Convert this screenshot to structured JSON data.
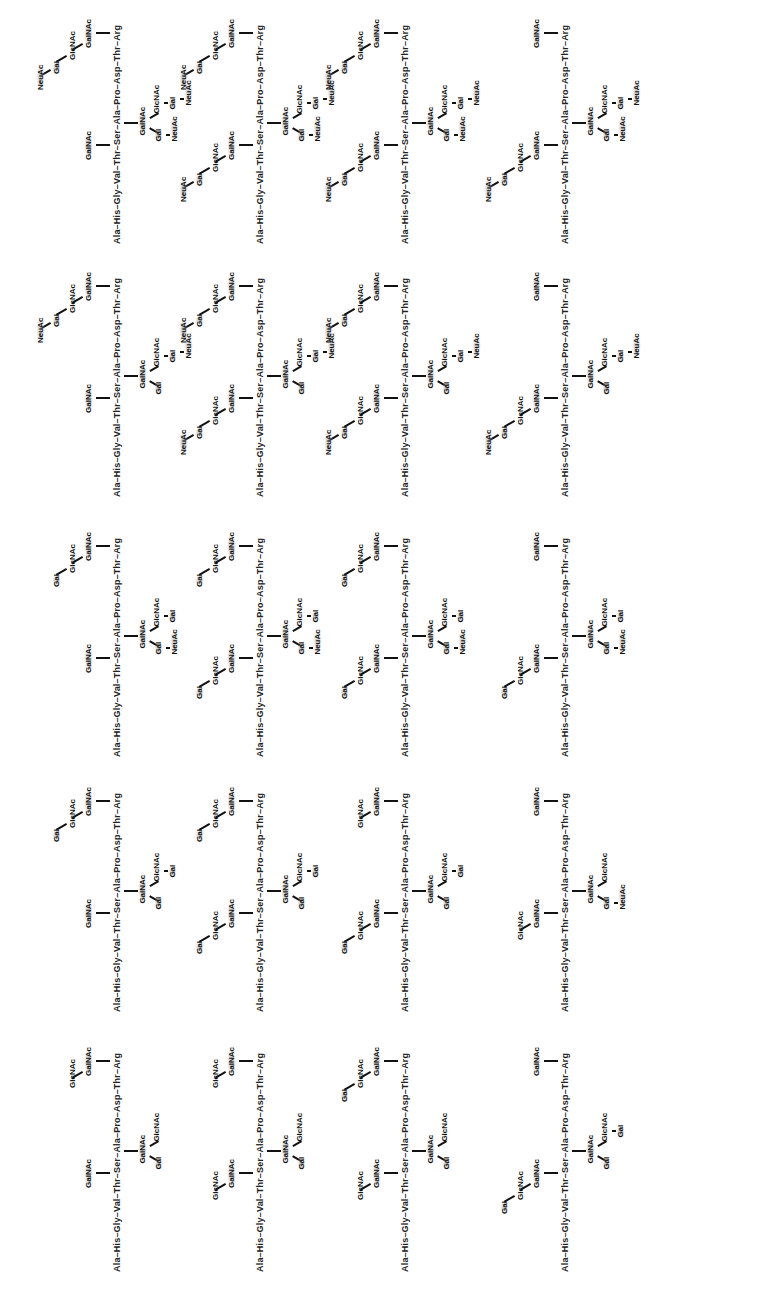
{
  "figure": {
    "orientation": "rotated-90-ccw",
    "peptide": [
      "Ala",
      "His",
      "Gly",
      "Val",
      "Thr",
      "Ser",
      "Ala",
      "Pro",
      "Asp",
      "Thr",
      "Arg"
    ],
    "glycosylation_sites": [
      "Thr5",
      "Ser6",
      "Thr10"
    ],
    "grid": {
      "columns": 4,
      "bands": 5
    },
    "structures": [
      {
        "id": "c0b0",
        "thr5": [
          "GalNAc"
        ],
        "ser6": {
          "core": "GalNAc",
          "arm3": [
            "Gal",
            "NeuAc"
          ],
          "arm6": [
            "GlcNAc",
            "Gal",
            "NeuAc"
          ]
        },
        "thr10": [
          "GalNAc",
          "GlcNAc",
          "Gal",
          "NeuAc"
        ]
      },
      {
        "id": "c0b1",
        "thr5": [
          "GalNAc"
        ],
        "ser6": {
          "core": "GalNAc",
          "arm3": [
            "Gal"
          ],
          "arm6": [
            "GlcNAc",
            "Gal",
            "NeuAc"
          ]
        },
        "thr10": [
          "GalNAc",
          "GlcNAc",
          "Gal",
          "NeuAc"
        ]
      },
      {
        "id": "c0b2",
        "thr5": [
          "GalNAc"
        ],
        "ser6": {
          "core": "GalNAc",
          "arm3": [
            "Gal",
            "NeuAc"
          ],
          "arm6": [
            "GlcNAc",
            "Gal"
          ]
        },
        "thr10": [
          "GalNAc",
          "GlcNAc",
          "Gal"
        ]
      },
      {
        "id": "c0b3",
        "thr5": [
          "GalNAc"
        ],
        "ser6": {
          "core": "GalNAc",
          "arm3": [
            "Gal"
          ],
          "arm6": [
            "GlcNAc",
            "Gal"
          ]
        },
        "thr10": [
          "GalNAc",
          "GlcNAc",
          "Gal"
        ]
      },
      {
        "id": "c0b4",
        "thr5": [
          "GalNAc"
        ],
        "ser6": {
          "core": "GalNAc",
          "arm3": [
            "Gal"
          ],
          "arm6": [
            "GlcNAc"
          ]
        },
        "thr10": [
          "GalNAc",
          "GlcNAc"
        ]
      },
      {
        "id": "c1b0",
        "thr5": [
          "GalNAc",
          "GlcNAc",
          "Gal",
          "NeuAc"
        ],
        "ser6": {
          "core": "GalNAc",
          "arm3": [
            "Gal",
            "NeuAc"
          ],
          "arm6": [
            "GlcNAc",
            "Gal",
            "NeuAc"
          ]
        },
        "thr10": [
          "GalNAc",
          "GlcNAc",
          "Gal",
          "NeuAc"
        ]
      },
      {
        "id": "c1b1",
        "thr5": [
          "GalNAc",
          "GlcNAc",
          "Gal",
          "NeuAc"
        ],
        "ser6": {
          "core": "GalNAc",
          "arm3": [
            "Gal"
          ],
          "arm6": [
            "GlcNAc",
            "Gal",
            "NeuAc"
          ]
        },
        "thr10": [
          "GalNAc",
          "GlcNAc",
          "Gal",
          "NeuAc"
        ]
      },
      {
        "id": "c1b2",
        "thr5": [
          "GalNAc",
          "GlcNAc",
          "Gal"
        ],
        "ser6": {
          "core": "GalNAc",
          "arm3": [
            "Gal",
            "NeuAc"
          ],
          "arm6": [
            "GlcNAc",
            "Gal"
          ]
        },
        "thr10": [
          "GalNAc",
          "GlcNAc",
          "Gal"
        ]
      },
      {
        "id": "c1b3",
        "thr5": [
          "GalNAc",
          "GlcNAc",
          "Gal"
        ],
        "ser6": {
          "core": "GalNAc",
          "arm3": [
            "Gal"
          ],
          "arm6": [
            "GlcNAc",
            "Gal"
          ]
        },
        "thr10": [
          "GalNAc",
          "GlcNAc",
          "Gal"
        ]
      },
      {
        "id": "c1b4",
        "thr5": [
          "GalNAc",
          "GlcNAc"
        ],
        "ser6": {
          "core": "GalNAc",
          "arm3": [
            "Gal"
          ],
          "arm6": [
            "GlcNAc"
          ]
        },
        "thr10": [
          "GalNAc",
          "GlcNAc"
        ]
      },
      {
        "id": "c2b0",
        "thr5": [
          "GalNAc",
          "GlcNAc",
          "Gal",
          "NeuAc"
        ],
        "ser6": {
          "core": "GalNAc",
          "arm3": [
            "Gal",
            "NeuAc"
          ],
          "arm6": [
            "GlcNAc",
            "Gal",
            "NeuAc"
          ]
        },
        "thr10": [
          "GalNAc",
          "GlcNAc",
          "Gal",
          "NeuAc"
        ]
      },
      {
        "id": "c2b1",
        "thr5": [
          "GalNAc",
          "GlcNAc",
          "Gal",
          "NeuAc"
        ],
        "ser6": {
          "core": "GalNAc",
          "arm3": [
            "Gal"
          ],
          "arm6": [
            "GlcNAc",
            "Gal",
            "NeuAc"
          ]
        },
        "thr10": [
          "GalNAc",
          "GlcNAc",
          "Gal",
          "NeuAc"
        ]
      },
      {
        "id": "c2b2",
        "thr5": [
          "GalNAc",
          "GlcNAc",
          "Gal"
        ],
        "ser6": {
          "core": "GalNAc",
          "arm3": [
            "Gal",
            "NeuAc"
          ],
          "arm6": [
            "GlcNAc",
            "Gal"
          ]
        },
        "thr10": [
          "GalNAc",
          "GlcNAc",
          "Gal"
        ]
      },
      {
        "id": "c2b3",
        "thr5": [
          "GalNAc",
          "GlcNAc",
          "Gal"
        ],
        "ser6": {
          "core": "GalNAc",
          "arm3": [
            "Gal"
          ],
          "arm6": [
            "GlcNAc",
            "Gal"
          ]
        },
        "thr10": [
          "GalNAc",
          "GlcNAc"
        ]
      },
      {
        "id": "c2b4",
        "thr5": [
          "GalNAc",
          "GlcNAc"
        ],
        "ser6": {
          "core": "GalNAc",
          "arm3": [
            "Gal"
          ],
          "arm6": [
            "GlcNAc"
          ]
        },
        "thr10": [
          "GalNAc",
          "GlcNAc",
          "Gal"
        ]
      },
      {
        "id": "c3b0",
        "thr5": [
          "GalNAc",
          "GlcNAc",
          "Gal",
          "NeuAc"
        ],
        "ser6": {
          "core": "GalNAc",
          "arm3": [
            "Gal",
            "NeuAc"
          ],
          "arm6": [
            "GlcNAc",
            "Gal",
            "NeuAc"
          ]
        },
        "thr10": [
          "GalNAc"
        ]
      },
      {
        "id": "c3b1",
        "thr5": [
          "GalNAc",
          "GlcNAc",
          "Gal",
          "NeuAc"
        ],
        "ser6": {
          "core": "GalNAc",
          "arm3": [
            "Gal"
          ],
          "arm6": [
            "GlcNAc",
            "Gal",
            "NeuAc"
          ]
        },
        "thr10": [
          "GalNAc"
        ]
      },
      {
        "id": "c3b2",
        "thr5": [
          "GalNAc",
          "GlcNAc",
          "Gal"
        ],
        "ser6": {
          "core": "GalNAc",
          "arm3": [
            "Gal",
            "NeuAc"
          ],
          "arm6": [
            "GlcNAc",
            "Gal"
          ]
        },
        "thr10": [
          "GalNAc"
        ]
      },
      {
        "id": "c3b3",
        "thr5": [
          "GalNAc",
          "GlcNAc"
        ],
        "ser6": {
          "core": "GalNAc",
          "arm3": [
            "Gal",
            "NeuAc"
          ],
          "arm6": [
            "GlcNAc"
          ]
        },
        "thr10": [
          "GalNAc"
        ]
      },
      {
        "id": "c3b4",
        "thr5": [
          "GalNAc",
          "GlcNAc",
          "Gal"
        ],
        "ser6": {
          "core": "GalNAc",
          "arm3": [
            "Gal"
          ],
          "arm6": [
            "GlcNAc",
            "Gal"
          ]
        },
        "thr10": [
          "GalNAc"
        ]
      }
    ]
  },
  "layout": {
    "column_x": [
      112,
      255,
      400,
      560
    ],
    "band_y": [
      262,
      515,
      775,
      1030,
      1290
    ]
  }
}
